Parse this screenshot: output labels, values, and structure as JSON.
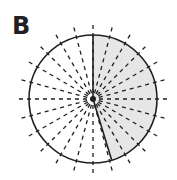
{
  "panel_label": "B",
  "diagram": {
    "center": [
      93,
      99
    ],
    "radius": 64,
    "ray_count": 24,
    "ray_step_deg": 15,
    "shaded_sector": {
      "start_deg": 0,
      "end_deg": 163,
      "fill": "#e6e6e6"
    },
    "stroke_color": "#231f20"
  }
}
